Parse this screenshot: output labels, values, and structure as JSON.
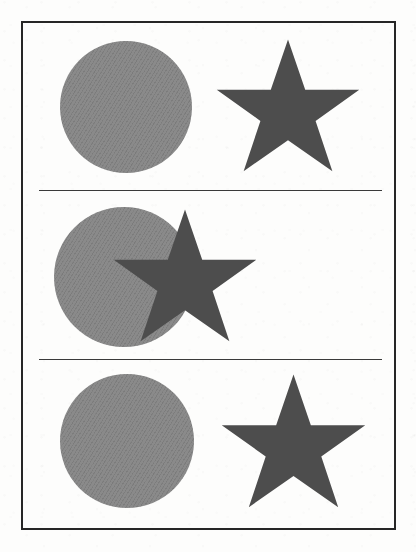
{
  "figure": {
    "background_color": "#fdfdfc",
    "frame": {
      "name": "figure-frame",
      "color": "#262626",
      "stroke_width_px": 2,
      "x": 21,
      "y": 21,
      "width": 375,
      "height": 509
    },
    "dividers": [
      {
        "name": "divider-1",
        "y": 188,
        "x1": 37,
        "x2": 380,
        "color": "#3a3a3a",
        "stroke_width_px": 1.6
      },
      {
        "name": "divider-2",
        "y": 357,
        "x1": 37,
        "x2": 380,
        "color": "#3a3a3a",
        "stroke_width_px": 1.6
      }
    ],
    "palette": {
      "circle_fill": "#8a8a8a",
      "star_fill": "#4d4d4d",
      "frame_stroke": "#262626",
      "divider_stroke": "#3a3a3a",
      "paper": "#fdfdfc"
    },
    "panels": [
      {
        "id": "panel-1",
        "index": 1,
        "label": "top panel",
        "arrangement": "separate",
        "z_order": "none",
        "shapes": [
          {
            "name": "circle",
            "type": "circle",
            "fill": "#8a8a8a",
            "center_x": 124,
            "center_y": 105,
            "radius": 66,
            "left": 58,
            "top": 39,
            "width": 132,
            "height": 132
          },
          {
            "name": "star",
            "type": "star",
            "points": 5,
            "fill": "#4d4d4d",
            "center_x": 286,
            "center_y": 108,
            "left": 213,
            "top": 36,
            "width": 146,
            "height": 137,
            "rotation_deg": 0
          }
        ]
      },
      {
        "id": "panel-2",
        "index": 2,
        "label": "middle panel",
        "arrangement": "overlapping",
        "z_order": "star above circle",
        "shapes": [
          {
            "name": "circle",
            "type": "circle",
            "fill": "#8a8a8a",
            "center_x": 122,
            "center_y": 275,
            "radius": 70,
            "left": 52,
            "top": 205,
            "width": 140,
            "height": 140
          },
          {
            "name": "star",
            "type": "star",
            "points": 5,
            "fill": "#4d4d4d",
            "center_x": 183,
            "center_y": 277,
            "left": 110,
            "top": 206,
            "width": 146,
            "height": 137,
            "rotation_deg": 0
          }
        ]
      },
      {
        "id": "panel-3",
        "index": 3,
        "label": "bottom panel",
        "arrangement": "separate",
        "z_order": "none",
        "shapes": [
          {
            "name": "circle",
            "type": "circle",
            "fill": "#8a8a8a",
            "center_x": 125,
            "center_y": 439,
            "radius": 67,
            "left": 58,
            "top": 372,
            "width": 134,
            "height": 134
          },
          {
            "name": "star",
            "type": "star",
            "points": 5,
            "fill": "#4d4d4d",
            "center_x": 291,
            "center_y": 441,
            "left": 218,
            "top": 371,
            "width": 147,
            "height": 138,
            "rotation_deg": 0
          }
        ]
      }
    ]
  }
}
